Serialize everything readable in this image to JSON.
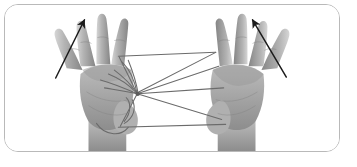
{
  "figure": {
    "caption": "",
    "frame": {
      "border_color": "#b9b9b9",
      "border_radius_px": 14,
      "background": "#ffffff",
      "x": 4,
      "y": 4,
      "width": 336,
      "height": 148
    },
    "photo": {
      "kind": "photograph",
      "color_mode": "grayscale",
      "background": "#ffffff",
      "skin_light": "#c9c9c9",
      "skin_mid": "#a8a8a8",
      "skin_dark": "#8a8a8a",
      "skin_shadow": "#6f6f6f",
      "string_color": "#6b6b6b",
      "arrow_color": "#1c1c1c"
    },
    "subjects": [
      {
        "name": "left-hand",
        "label": "Left hand, palm forward, fingers spread",
        "wrist_x": 108,
        "wrist_y": 145
      },
      {
        "name": "right-hand",
        "label": "Right hand, palm forward, fingers spread",
        "wrist_x": 232,
        "wrist_y": 145
      }
    ],
    "strings": [
      {
        "name": "upper-span",
        "from": [
          118,
          56
        ],
        "to": [
          216,
          52
        ]
      },
      {
        "name": "lower-span",
        "from": [
          118,
          128
        ],
        "to": [
          226,
          125
        ]
      },
      {
        "name": "knot-to-upper-right",
        "from": [
          137,
          94
        ],
        "to": [
          219,
          66
        ]
      },
      {
        "name": "knot-to-mid-right",
        "from": [
          137,
          94
        ],
        "to": [
          224,
          88
        ]
      },
      {
        "name": "knot-to-lower-right",
        "from": [
          137,
          94
        ],
        "to": [
          222,
          120
        ]
      },
      {
        "name": "knot-to-upper-left",
        "from": [
          137,
          94
        ],
        "to": [
          119,
          57
        ]
      },
      {
        "name": "knot-to-lower-left",
        "from": [
          137,
          94
        ],
        "to": [
          120,
          127
        ]
      },
      {
        "name": "diagonal-long",
        "from": [
          216,
          52
        ],
        "to": [
          139,
          92
        ]
      }
    ],
    "arrows": [
      {
        "name": "left-motion-arrow",
        "label": "Left index finger motion",
        "from": [
          55,
          78
        ],
        "to": [
          84,
          18
        ],
        "direction": "up-right"
      },
      {
        "name": "right-motion-arrow",
        "label": "Right index finger motion",
        "from": [
          287,
          77
        ],
        "to": [
          253,
          18
        ],
        "direction": "up-left"
      }
    ]
  }
}
